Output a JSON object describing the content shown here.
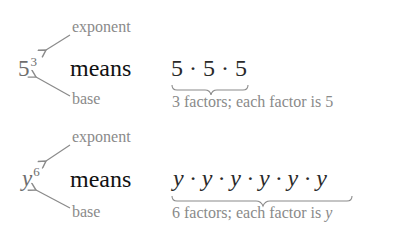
{
  "examples": [
    {
      "base": "5",
      "exponent": "3",
      "base_italic": false,
      "exponent_label": "exponent",
      "base_label": "base",
      "means_label": "means",
      "expansion": "5 · 5 · 5",
      "expansion_italic": false,
      "caption": "3 factors; each factor is 5"
    },
    {
      "base": "y",
      "exponent": "6",
      "base_italic": true,
      "exponent_label": "exponent",
      "base_label": "base",
      "means_label": "means",
      "expansion": "y · y · y · y · y · y",
      "expansion_italic": true,
      "caption_prefix": "6 factors; each factor is ",
      "caption_var": "y"
    }
  ],
  "colors": {
    "label_gray": "#8a8a8a",
    "arrow_gray": "#8a8a8a",
    "text_dark": "#111111"
  }
}
